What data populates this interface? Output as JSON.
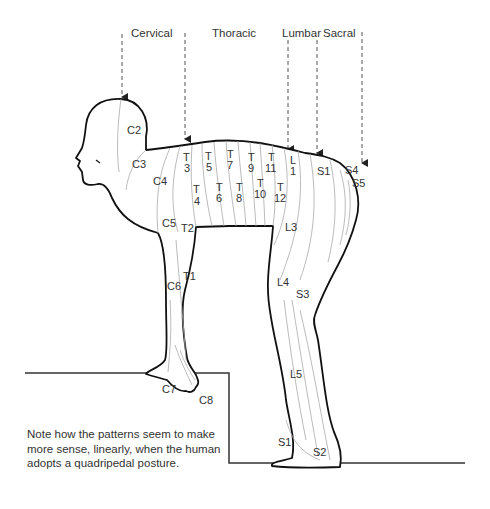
{
  "diagram": {
    "regions": [
      {
        "name": "Cervical",
        "x": 130,
        "y": 37
      },
      {
        "name": "Thoracic",
        "x": 212,
        "y": 37
      },
      {
        "name": "Lumbar",
        "x": 282,
        "y": 37
      },
      {
        "name": "Sacral",
        "x": 323,
        "y": 37
      }
    ],
    "labels": [
      {
        "id": "C2",
        "text": "C2",
        "x": 127,
        "y": 134
      },
      {
        "id": "C3",
        "text": "C3",
        "x": 113,
        "y": 167
      },
      {
        "id": "C4",
        "text": "C4",
        "x": 153,
        "y": 185
      },
      {
        "id": "C5",
        "text": "C5",
        "x": 163,
        "y": 227
      },
      {
        "id": "C6",
        "text": "C6",
        "x": 167,
        "y": 290
      },
      {
        "id": "C7",
        "text": "C7",
        "x": 162,
        "y": 393
      },
      {
        "id": "C8",
        "text": "C8",
        "x": 199,
        "y": 404
      },
      {
        "id": "T1",
        "text": "T1",
        "x": 183,
        "y": 280
      },
      {
        "id": "T2",
        "text": "T2",
        "x": 182,
        "y": 232
      },
      {
        "id": "T3",
        "text": "T\n3",
        "x": 183,
        "y": 162
      },
      {
        "id": "T4",
        "text": "T\n4",
        "x": 193,
        "y": 197
      },
      {
        "id": "T5",
        "text": "T\n5",
        "x": 205,
        "y": 162
      },
      {
        "id": "T6",
        "text": "T\n6",
        "x": 216,
        "y": 193
      },
      {
        "id": "T7",
        "text": "T\n7",
        "x": 226,
        "y": 160
      },
      {
        "id": "T8",
        "text": "T\n8",
        "x": 236,
        "y": 193
      },
      {
        "id": "T9",
        "text": "T\n9",
        "x": 247,
        "y": 164
      },
      {
        "id": "T10",
        "text": "T\n10",
        "x": 255,
        "y": 189
      },
      {
        "id": "T11",
        "text": "T\n11",
        "x": 266,
        "y": 164
      },
      {
        "id": "T12",
        "text": "T\n12",
        "x": 276,
        "y": 193
      },
      {
        "id": "L1",
        "text": "L\n1",
        "x": 290,
        "y": 166
      },
      {
        "id": "L2",
        "text": "L2",
        "x": 285,
        "y": 231
      },
      {
        "id": "L3",
        "text": "L3",
        "x": 277,
        "y": 286
      },
      {
        "id": "L4",
        "text": "L4",
        "x": 290,
        "y": 378
      },
      {
        "id": "L5",
        "text": "L5",
        "x": 278,
        "y": 446
      },
      {
        "id": "S1a",
        "text": "S1",
        "x": 317,
        "y": 175
      },
      {
        "id": "S1b",
        "text": "S1",
        "x": 313,
        "y": 456
      },
      {
        "id": "S2",
        "text": "S2",
        "x": 296,
        "y": 298
      },
      {
        "id": "S3",
        "text": "S3",
        "x": 345,
        "y": 174
      },
      {
        "id": "S4",
        "text": "S4",
        "x": 352,
        "y": 187
      },
      {
        "id": "S5",
        "text": "S5",
        "x": 355,
        "y": 206
      }
    ]
  },
  "note": {
    "text": "Note how the patterns seem to make more sense, linearly, when the human adopts a quadripedal posture."
  },
  "colors": {
    "outline": "#111111",
    "dermatome_lines": "#aaaaaa",
    "arrows": "#444444",
    "text": "#333333"
  }
}
